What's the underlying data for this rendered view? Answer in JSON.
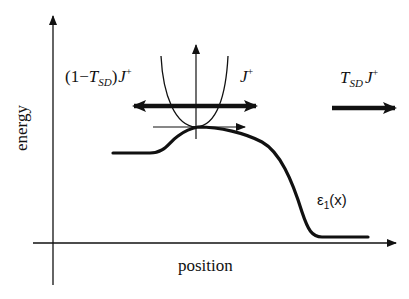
{
  "diagram": {
    "axes": {
      "y_label": "energy",
      "x_label": "position"
    },
    "labels": {
      "reflected_flux": {
        "prefix": "(1−",
        "T": "T",
        "T_sub": "SD",
        "suffix": ")",
        "J": "J",
        "J_sup": "+"
      },
      "incident_flux": {
        "J": "J",
        "J_sup": "+"
      },
      "transmitted_flux": {
        "T": "T",
        "T_sub": "SD",
        "J": "J",
        "J_sup": "+"
      },
      "band_curve": {
        "eps": "ε",
        "sub": "1",
        "arg": "(x)"
      }
    },
    "elements": [
      "main energy axis (vertical, arrow up)",
      "main position axis (horizontal, arrow right)",
      "band profile curve ε1(x) with barrier maximum",
      "inset parabola (dispersion) at barrier top with local axes",
      "thick double-headed arrow through parabola (incident/reflected flux)",
      "thick right arrow (transmitted flux)"
    ],
    "colors": {
      "ink": "#111111",
      "background": "#ffffff"
    }
  }
}
